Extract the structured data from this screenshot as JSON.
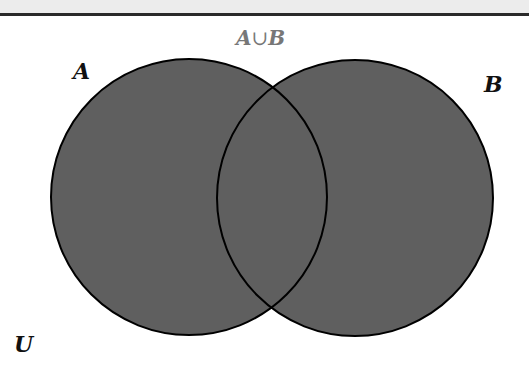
{
  "diagram": {
    "type": "venn",
    "title": {
      "left": "A",
      "operator": "∪",
      "right": "B"
    },
    "sets": [
      {
        "label": "A",
        "cx": 189,
        "cy": 197,
        "r": 138
      },
      {
        "label": "B",
        "cx": 355,
        "cy": 198,
        "r": 138
      }
    ],
    "universe_label": "U",
    "shaded_region": "A ∪ B",
    "colors": {
      "fill": "#5f5f5f",
      "stroke": "#000000",
      "title": "#777777",
      "top_band": "#ececec",
      "top_rule": "#2a2a2a"
    }
  }
}
